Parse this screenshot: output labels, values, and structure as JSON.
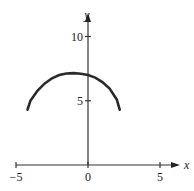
{
  "chart_data": {
    "type": "line",
    "title": "",
    "xlabel": "x",
    "ylabel": "y",
    "xlim": [
      -5,
      5
    ],
    "ylim": [
      0,
      10
    ],
    "x_ticks": [
      -5,
      0,
      5
    ],
    "y_ticks": [
      5,
      10
    ],
    "x_tick_labels": [
      "−5",
      "0",
      "5"
    ],
    "y_tick_labels": [
      "5",
      "10"
    ],
    "grid": false,
    "series": [
      {
        "name": "curve",
        "x": [
          -4.2,
          -4.0,
          -3.5,
          -3.0,
          -2.5,
          -2.0,
          -1.5,
          -1.0,
          -0.5,
          0.0,
          0.5,
          1.0,
          1.5,
          2.0,
          2.2
        ],
        "y": [
          4.3,
          5.0,
          5.8,
          6.35,
          6.75,
          7.0,
          7.12,
          7.15,
          7.1,
          7.0,
          6.8,
          6.45,
          5.95,
          5.1,
          4.3
        ]
      }
    ]
  }
}
